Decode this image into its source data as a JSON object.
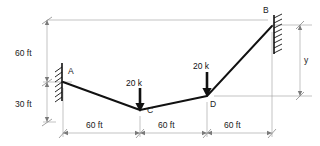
{
  "figure": {
    "type": "structural-cable-diagram",
    "background_color": "#ffffff",
    "line_color": "#111111",
    "dimension_color": "#8a8a8a"
  },
  "nodes": [
    {
      "id": "A",
      "label": "A",
      "x": 63,
      "y": 82,
      "support": "fixed-wall-left"
    },
    {
      "id": "C",
      "label": "C",
      "x": 140,
      "y": 110,
      "support": "none"
    },
    {
      "id": "D",
      "label": "D",
      "x": 207,
      "y": 96,
      "support": "none"
    },
    {
      "id": "B",
      "label": "B",
      "x": 272,
      "y": 26,
      "support": "fixed-wall-right"
    }
  ],
  "members": [
    {
      "from": "A",
      "to": "C"
    },
    {
      "from": "C",
      "to": "D"
    },
    {
      "from": "D",
      "to": "B"
    }
  ],
  "loads": [
    {
      "at": "C",
      "label": "20 k",
      "direction": "down",
      "magnitude": 20,
      "unit": "k"
    },
    {
      "at": "D",
      "label": "20 k",
      "direction": "down",
      "magnitude": 20,
      "unit": "k"
    }
  ],
  "vertical_dimensions": [
    {
      "label": "60 ft",
      "value": 60,
      "unit": "ft",
      "from": "datum-top",
      "to": "A"
    },
    {
      "label": "30 ft",
      "value": 30,
      "unit": "ft",
      "from": "A",
      "to": "baseline"
    }
  ],
  "horizontal_dimensions": [
    {
      "label": "60 ft",
      "value": 60,
      "unit": "ft",
      "from": "A",
      "to": "C"
    },
    {
      "label": "60 ft",
      "value": 60,
      "unit": "ft",
      "from": "C",
      "to": "D"
    },
    {
      "label": "60 ft",
      "value": 60,
      "unit": "ft",
      "from": "D",
      "to": "B"
    }
  ],
  "unknown_dimensions": [
    {
      "label": "y",
      "from": "datum-top",
      "to": "D",
      "side": "right"
    }
  ]
}
